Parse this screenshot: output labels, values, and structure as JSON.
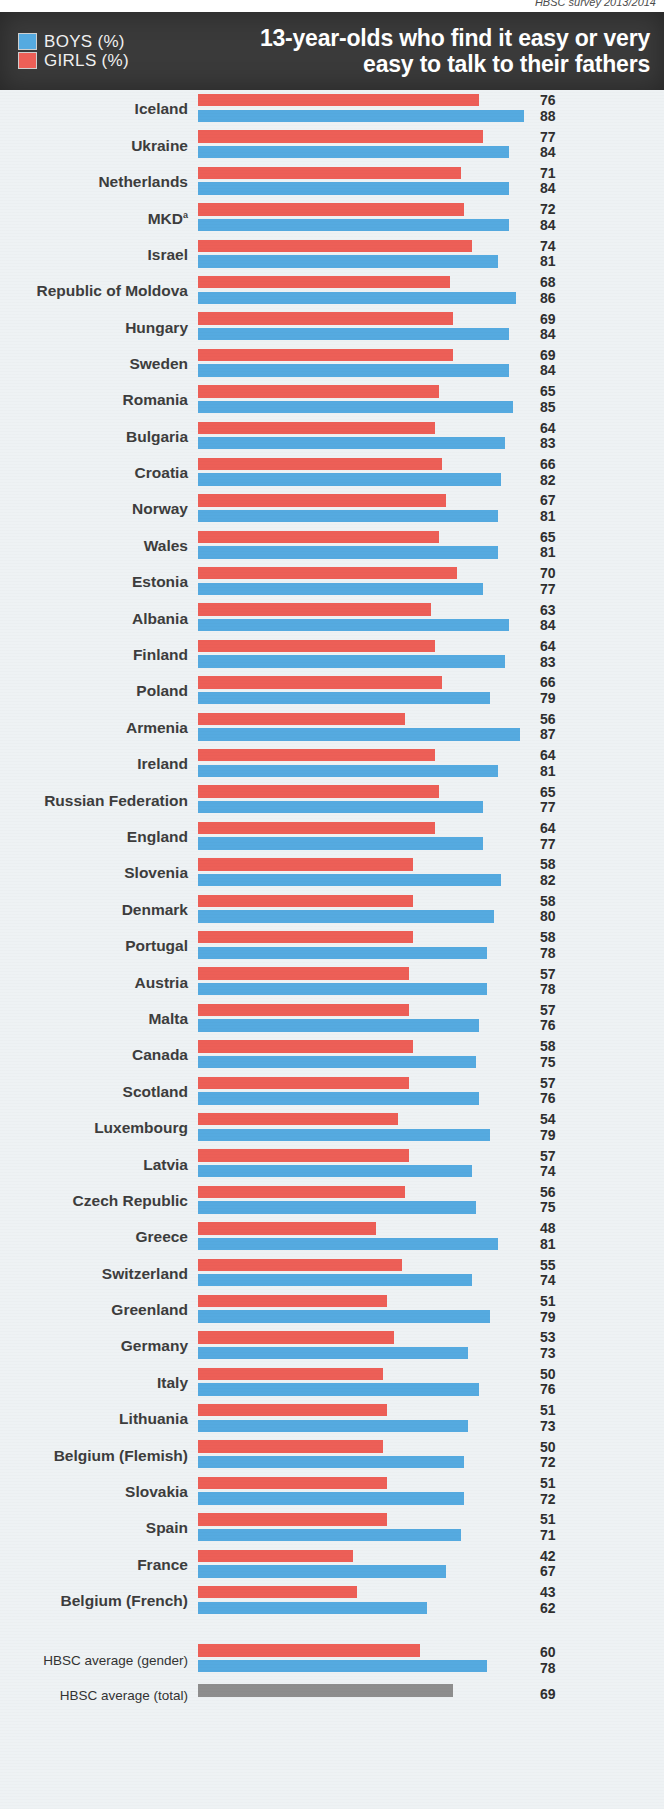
{
  "source_note": "HBSC survey 2013/2014",
  "header": {
    "title": "13-year-olds who find it easy or very easy to talk to their fathers",
    "legend": [
      {
        "key": "boys",
        "label": "BOYS (%)",
        "color": "#55aae0",
        "icon": "blue-swatch"
      },
      {
        "key": "girls",
        "label": "GIRLS (%)",
        "color": "#ed5f57",
        "icon": "red-swatch"
      }
    ]
  },
  "colors": {
    "boys": "#55aae0",
    "girls": "#ed5f57",
    "total": "#8e8e8e",
    "header_band": "#3a3a3a",
    "background": "#eef2f4"
  },
  "averages": {
    "gender_label": "HBSC average (gender)",
    "total_label": "HBSC average (total)",
    "girls": 60,
    "boys": 78,
    "total": 69
  },
  "footnote_marker": "a",
  "chart_data": {
    "type": "bar",
    "orientation": "horizontal",
    "title": "13-year-olds who find it easy or very easy to talk to their fathers",
    "xlabel": "",
    "ylabel": "",
    "xlim": [
      0,
      100
    ],
    "grid": false,
    "legend_position": "top-left",
    "categories": [
      "Iceland",
      "Ukraine",
      "Netherlands",
      "MKD",
      "Israel",
      "Republic of Moldova",
      "Hungary",
      "Sweden",
      "Romania",
      "Bulgaria",
      "Croatia",
      "Norway",
      "Wales",
      "Estonia",
      "Albania",
      "Finland",
      "Poland",
      "Armenia",
      "Ireland",
      "Russian Federation",
      "England",
      "Slovenia",
      "Denmark",
      "Portugal",
      "Austria",
      "Malta",
      "Canada",
      "Scotland",
      "Luxembourg",
      "Latvia",
      "Czech Republic",
      "Greece",
      "Switzerland",
      "Greenland",
      "Germany",
      "Italy",
      "Lithuania",
      "Belgium (Flemish)",
      "Slovakia",
      "Spain",
      "France",
      "Belgium (French)"
    ],
    "series": [
      {
        "name": "GIRLS (%)",
        "color": "#ed5f57",
        "values": [
          76,
          77,
          71,
          72,
          74,
          68,
          69,
          69,
          65,
          64,
          66,
          67,
          65,
          70,
          63,
          64,
          66,
          56,
          64,
          65,
          64,
          58,
          58,
          58,
          57,
          57,
          58,
          57,
          54,
          57,
          56,
          48,
          55,
          51,
          53,
          50,
          51,
          50,
          51,
          51,
          42,
          43
        ]
      },
      {
        "name": "BOYS (%)",
        "color": "#55aae0",
        "values": [
          88,
          84,
          84,
          84,
          81,
          86,
          84,
          84,
          85,
          83,
          82,
          81,
          81,
          77,
          84,
          83,
          79,
          87,
          81,
          77,
          77,
          82,
          80,
          78,
          78,
          76,
          75,
          76,
          79,
          74,
          75,
          81,
          74,
          79,
          73,
          76,
          73,
          72,
          72,
          71,
          67,
          62
        ]
      }
    ]
  },
  "rows": [
    {
      "country": "Iceland",
      "sup": "",
      "girls": 76,
      "boys": 88
    },
    {
      "country": "Ukraine",
      "sup": "",
      "girls": 77,
      "boys": 84
    },
    {
      "country": "Netherlands",
      "sup": "",
      "girls": 71,
      "boys": 84
    },
    {
      "country": "MKD",
      "sup": "a",
      "girls": 72,
      "boys": 84
    },
    {
      "country": "Israel",
      "sup": "",
      "girls": 74,
      "boys": 81
    },
    {
      "country": "Republic of Moldova",
      "sup": "",
      "girls": 68,
      "boys": 86
    },
    {
      "country": "Hungary",
      "sup": "",
      "girls": 69,
      "boys": 84
    },
    {
      "country": "Sweden",
      "sup": "",
      "girls": 69,
      "boys": 84
    },
    {
      "country": "Romania",
      "sup": "",
      "girls": 65,
      "boys": 85
    },
    {
      "country": "Bulgaria",
      "sup": "",
      "girls": 64,
      "boys": 83
    },
    {
      "country": "Croatia",
      "sup": "",
      "girls": 66,
      "boys": 82
    },
    {
      "country": "Norway",
      "sup": "",
      "girls": 67,
      "boys": 81
    },
    {
      "country": "Wales",
      "sup": "",
      "girls": 65,
      "boys": 81
    },
    {
      "country": "Estonia",
      "sup": "",
      "girls": 70,
      "boys": 77
    },
    {
      "country": "Albania",
      "sup": "",
      "girls": 63,
      "boys": 84
    },
    {
      "country": "Finland",
      "sup": "",
      "girls": 64,
      "boys": 83
    },
    {
      "country": "Poland",
      "sup": "",
      "girls": 66,
      "boys": 79
    },
    {
      "country": "Armenia",
      "sup": "",
      "girls": 56,
      "boys": 87
    },
    {
      "country": "Ireland",
      "sup": "",
      "girls": 64,
      "boys": 81
    },
    {
      "country": "Russian Federation",
      "sup": "",
      "girls": 65,
      "boys": 77
    },
    {
      "country": "England",
      "sup": "",
      "girls": 64,
      "boys": 77
    },
    {
      "country": "Slovenia",
      "sup": "",
      "girls": 58,
      "boys": 82
    },
    {
      "country": "Denmark",
      "sup": "",
      "girls": 58,
      "boys": 80
    },
    {
      "country": "Portugal",
      "sup": "",
      "girls": 58,
      "boys": 78
    },
    {
      "country": "Austria",
      "sup": "",
      "girls": 57,
      "boys": 78
    },
    {
      "country": "Malta",
      "sup": "",
      "girls": 57,
      "boys": 76
    },
    {
      "country": "Canada",
      "sup": "",
      "girls": 58,
      "boys": 75
    },
    {
      "country": "Scotland",
      "sup": "",
      "girls": 57,
      "boys": 76
    },
    {
      "country": "Luxembourg",
      "sup": "",
      "girls": 54,
      "boys": 79
    },
    {
      "country": "Latvia",
      "sup": "",
      "girls": 57,
      "boys": 74
    },
    {
      "country": "Czech Republic",
      "sup": "",
      "girls": 56,
      "boys": 75
    },
    {
      "country": "Greece",
      "sup": "",
      "girls": 48,
      "boys": 81
    },
    {
      "country": "Switzerland",
      "sup": "",
      "girls": 55,
      "boys": 74
    },
    {
      "country": "Greenland",
      "sup": "",
      "girls": 51,
      "boys": 79
    },
    {
      "country": "Germany",
      "sup": "",
      "girls": 53,
      "boys": 73
    },
    {
      "country": "Italy",
      "sup": "",
      "girls": 50,
      "boys": 76
    },
    {
      "country": "Lithuania",
      "sup": "",
      "girls": 51,
      "boys": 73
    },
    {
      "country": "Belgium (Flemish)",
      "sup": "",
      "girls": 50,
      "boys": 72
    },
    {
      "country": "Slovakia",
      "sup": "",
      "girls": 51,
      "boys": 72
    },
    {
      "country": "Spain",
      "sup": "",
      "girls": 51,
      "boys": 71
    },
    {
      "country": "France",
      "sup": "",
      "girls": 42,
      "boys": 67
    },
    {
      "country": "Belgium (French)",
      "sup": "",
      "girls": 43,
      "boys": 62
    }
  ]
}
